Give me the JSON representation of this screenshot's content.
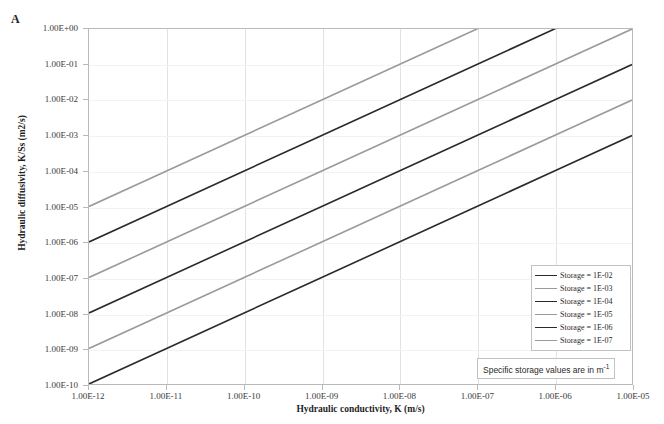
{
  "panel": {
    "letter": "A"
  },
  "axes": {
    "x": {
      "title": "Hydraulic conductivity, K (m/s)",
      "ticks": [
        "1.00E-12",
        "1.00E-11",
        "1.00E-10",
        "1.00E-09",
        "1.00E-08",
        "1.00E-07",
        "1.00E-06",
        "1.00E-05"
      ]
    },
    "y": {
      "title": "Hydraulic diffusivity, K/Ss (m2/s)",
      "ticks": [
        "1.00E+00",
        "1.00E-01",
        "1.00E-02",
        "1.00E-03",
        "1.00E-04",
        "1.00E-05",
        "1.00E-06",
        "1.00E-07",
        "1.00E-08",
        "1.00E-09",
        "1.00E-10"
      ]
    }
  },
  "legend": {
    "items": [
      {
        "label": "Storage = 1E-02",
        "color": "#2b2b2b"
      },
      {
        "label": "Storage = 1E-03",
        "color": "#9a9a9a"
      },
      {
        "label": "Storage = 1E-04",
        "color": "#2b2b2b"
      },
      {
        "label": "Storage = 1E-05",
        "color": "#9a9a9a"
      },
      {
        "label": "Storage = 1E-06",
        "color": "#2b2b2b"
      },
      {
        "label": "Storage = 1E-07",
        "color": "#9a9a9a"
      }
    ]
  },
  "footnote": {
    "text": "Specific storage values are in m",
    "superscript": "-1"
  },
  "chart_data": {
    "type": "line",
    "title": "",
    "xlabel": "Hydraulic conductivity, K (m/s)",
    "ylabel": "Hydraulic diffusivity, K/Ss (m2/s)",
    "xscale": "log",
    "yscale": "log",
    "xlim": [
      1e-12,
      1e-05
    ],
    "ylim": [
      1e-10,
      1.0
    ],
    "grid": "vertical",
    "legend_position": "lower-right",
    "x": [
      1e-12,
      1e-11,
      1e-10,
      1e-09,
      1e-08,
      1e-07,
      1e-06,
      1e-05
    ],
    "series": [
      {
        "name": "Storage = 1E-02",
        "storage": 0.01,
        "color": "#2b2b2b",
        "values": [
          1e-10,
          1e-09,
          1e-08,
          1e-07,
          1e-06,
          1e-05,
          0.0001,
          0.001
        ]
      },
      {
        "name": "Storage = 1E-03",
        "storage": 0.001,
        "color": "#9a9a9a",
        "values": [
          1e-09,
          1e-08,
          1e-07,
          1e-06,
          1e-05,
          0.0001,
          0.001,
          0.01
        ]
      },
      {
        "name": "Storage = 1E-04",
        "storage": 0.0001,
        "color": "#2b2b2b",
        "values": [
          1e-08,
          1e-07,
          1e-06,
          1e-05,
          0.0001,
          0.001,
          0.01,
          0.1
        ]
      },
      {
        "name": "Storage = 1E-05",
        "storage": 1e-05,
        "color": "#9a9a9a",
        "values": [
          1e-07,
          1e-06,
          1e-05,
          0.0001,
          0.001,
          0.01,
          0.1,
          1.0
        ]
      },
      {
        "name": "Storage = 1E-06",
        "storage": 1e-06,
        "color": "#2b2b2b",
        "values": [
          1e-06,
          1e-05,
          0.0001,
          0.001,
          0.01,
          0.1,
          1.0,
          10.0
        ]
      },
      {
        "name": "Storage = 1E-07",
        "storage": 1e-07,
        "color": "#9a9a9a",
        "values": [
          1e-05,
          0.0001,
          0.001,
          0.01,
          0.1,
          1.0,
          10.0,
          100.0
        ]
      }
    ],
    "annotation": "Specific storage values are in m-1"
  }
}
